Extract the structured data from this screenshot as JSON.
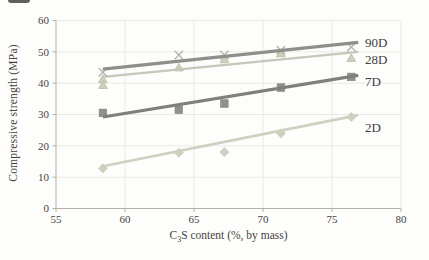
{
  "figure": {
    "background": "#fdfdfc"
  },
  "chart_data": {
    "type": "scatter",
    "title": "",
    "xlabel_prefix": "C",
    "xlabel_sub": "3",
    "xlabel_suffix": "S content (%, by mass)",
    "ylabel": "Compressive strength (MPa)",
    "xlim": [
      55,
      80
    ],
    "ylim": [
      0,
      60
    ],
    "xticks": [
      55,
      60,
      65,
      70,
      75,
      80
    ],
    "yticks": [
      0,
      10,
      20,
      30,
      40,
      50,
      60
    ],
    "grid": true,
    "legend_position": "right-inline",
    "axis_color": "#b3b1ac",
    "grid_color": "#e9e9e4",
    "tick_text_color": "#45443f",
    "label_text_color": "#403f3c",
    "series": [
      {
        "name": "2D",
        "marker": "diamond",
        "line_color": "#cdd1bf",
        "line_width": 2.6,
        "marker_color": "#ccd2c0",
        "marker_edge": "#bcc3ae",
        "points": {
          "x": [
            58.4,
            63.9,
            67.2,
            71.3,
            76.4
          ],
          "y": [
            12.8,
            17.8,
            18,
            24,
            29.2
          ]
        },
        "trend": {
          "x": [
            58.4,
            76.9
          ],
          "y": [
            13.5,
            29.8
          ]
        },
        "label": {
          "x": 77.4,
          "y": 25.6
        }
      },
      {
        "name": "7D",
        "marker": "square",
        "line_color": "#807f7c",
        "line_width": 3.2,
        "marker_color": "#908f8c",
        "marker_edge": "#84837f",
        "points": {
          "x": [
            58.4,
            63.9,
            67.2,
            71.3,
            76.4
          ],
          "y": [
            30.5,
            31.5,
            33.5,
            38.6,
            42
          ]
        },
        "trend": {
          "x": [
            58.4,
            76.9
          ],
          "y": [
            29.2,
            42.5
          ]
        },
        "label": {
          "x": 77.4,
          "y": 40.3
        }
      },
      {
        "name": "28D",
        "marker": "triangle",
        "line_color": "#c4c8b8",
        "line_width": 2.2,
        "marker_color": "#cbd1bc",
        "marker_edge": "#b6bda6",
        "points": {
          "x": [
            58.4,
            58.4,
            63.9,
            67.2,
            71.3,
            76.4
          ],
          "y": [
            41.3,
            39.4,
            45,
            47.6,
            49.5,
            48
          ]
        },
        "trend": {
          "x": [
            58.4,
            76.9
          ],
          "y": [
            42,
            50
          ]
        },
        "label": {
          "x": 77.4,
          "y": 47.3
        }
      },
      {
        "name": "90D",
        "marker": "x",
        "line_color": "#8f8e8a",
        "line_width": 3.2,
        "marker_color": "#b3b6b0",
        "marker_edge": "#b3b6b0",
        "points": {
          "x": [
            58.4,
            63.9,
            67.2,
            71.3,
            76.4
          ],
          "y": [
            43.5,
            49,
            49,
            50.5,
            51.5
          ]
        },
        "trend": {
          "x": [
            58.4,
            76.9
          ],
          "y": [
            44.5,
            53
          ]
        },
        "label": {
          "x": 77.4,
          "y": 52.8
        }
      }
    ]
  }
}
